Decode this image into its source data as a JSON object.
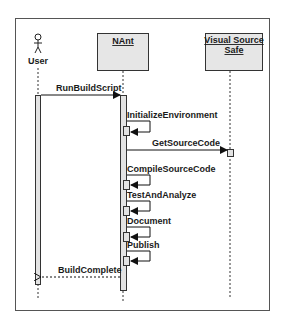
{
  "diagram": {
    "type": "sequence",
    "participants": [
      {
        "id": "user",
        "label": "User",
        "kind": "actor"
      },
      {
        "id": "nant",
        "label": "NAnt",
        "kind": "object"
      },
      {
        "id": "vss",
        "label_line1": "Visual Source",
        "label_line2": "Safe",
        "kind": "object"
      }
    ],
    "messages": [
      {
        "label": "RunBuildScript",
        "from": "user",
        "to": "nant",
        "style": "sync"
      },
      {
        "label": "InitializeEnvironment",
        "from": "nant",
        "to": "nant",
        "style": "self"
      },
      {
        "label": "GetSourceCode",
        "from": "nant",
        "to": "vss",
        "style": "sync"
      },
      {
        "label": "CompileSourceCode",
        "from": "nant",
        "to": "nant",
        "style": "self"
      },
      {
        "label": "TestAndAnalyze",
        "from": "nant",
        "to": "nant",
        "style": "self"
      },
      {
        "label": "Document",
        "from": "nant",
        "to": "nant",
        "style": "self"
      },
      {
        "label": "Publish",
        "from": "nant",
        "to": "nant",
        "style": "self"
      },
      {
        "label": "BuildComplete",
        "from": "nant",
        "to": "user",
        "style": "return"
      }
    ]
  },
  "colors": {
    "frame": "#555555",
    "box_fill": "#e6e6e6",
    "activation_fill": "#e3e3e3",
    "line": "#1a1a1a"
  }
}
